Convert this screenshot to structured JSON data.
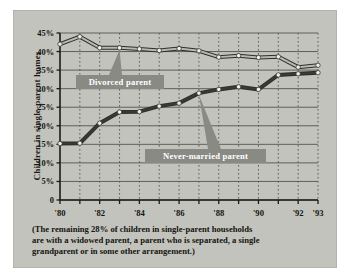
{
  "chart_data": {
    "type": "line",
    "title": "",
    "xlabel": "",
    "ylabel": "Children in single-parent homes",
    "ylim": [
      0,
      45
    ],
    "yticks": [
      "0",
      "5%",
      "10%",
      "15%",
      "20%",
      "25%",
      "30%",
      "35%",
      "40%",
      "45%"
    ],
    "ytick_values": [
      0,
      5,
      10,
      15,
      20,
      25,
      30,
      35,
      40,
      45
    ],
    "x": [
      1980,
      1981,
      1982,
      1983,
      1984,
      1985,
      1986,
      1987,
      1988,
      1989,
      1990,
      1991,
      1992,
      1993
    ],
    "xticks": [
      "'80",
      "'82",
      "'84",
      "'86",
      "'88",
      "'90",
      "'92",
      "'93"
    ],
    "xtick_values": [
      1980,
      1982,
      1984,
      1986,
      1988,
      1990,
      1992,
      1993
    ],
    "grid": true,
    "legend_position": "inline-callout",
    "series": [
      {
        "name": "Divorced parent",
        "values": [
          42.0,
          44.0,
          41.0,
          41.0,
          40.7,
          40.3,
          40.8,
          40.2,
          38.5,
          38.9,
          38.4,
          38.6,
          35.8,
          36.3
        ],
        "color": "#b9b9b3",
        "marker": "circle"
      },
      {
        "name": "Never-married parent",
        "values": [
          15.2,
          15.3,
          20.7,
          23.7,
          23.8,
          25.3,
          26.1,
          28.8,
          29.8,
          30.5,
          29.8,
          33.7,
          34.0,
          34.3
        ],
        "color": "#3a3a34",
        "marker": "circle"
      }
    ],
    "annotations": [
      {
        "label": "Divorced parent",
        "points_to_year": 1983,
        "points_to_value": 41.0
      },
      {
        "label": "Never-married parent",
        "points_to_year": 1987,
        "points_to_value": 28.8
      }
    ]
  },
  "caption": {
    "line1": "(The remaining 28% of children in single-parent households",
    "line2": "are with a widowed parent, a parent who is separated, a single",
    "line3": "grandparent or in some other arrangement.)"
  },
  "colors": {
    "panel_background": "#c3c3bd",
    "page_background": "#ffffff",
    "axis": "#1a1a18",
    "gridline": "#55554f",
    "divorced_line": "#b9b9b3",
    "never_married_line": "#3a3a34",
    "callout_fill": "#8a8a84",
    "callout_text": "#ffffff"
  }
}
